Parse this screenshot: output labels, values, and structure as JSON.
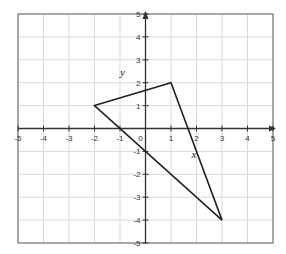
{
  "chart_data": {
    "type": "line",
    "title": "",
    "xlabel": "",
    "ylabel": "",
    "xlim": [
      -5,
      5
    ],
    "ylim": [
      -5,
      5
    ],
    "grid": true,
    "x_ticks": [
      -5,
      -4,
      -3,
      -2,
      -1,
      0,
      1,
      2,
      3,
      4,
      5
    ],
    "y_ticks": [
      -5,
      -4,
      -3,
      -2,
      -1,
      1,
      2,
      3,
      4,
      5
    ],
    "x_tick_labels": [
      "-5",
      "-4",
      "-3",
      "-2",
      "-1",
      "0",
      "1",
      "2",
      "3",
      "4",
      "5"
    ],
    "y_tick_labels": [
      "-5",
      "-4",
      "-3",
      "-2",
      "-1",
      "1",
      "2",
      "3",
      "4",
      "5"
    ],
    "series": [
      {
        "name": "triangle",
        "closed": true,
        "points": [
          [
            -2,
            1
          ],
          [
            1,
            2
          ],
          [
            3,
            -4
          ]
        ]
      }
    ],
    "annotations": [
      {
        "text": "y",
        "x": -0.9,
        "y": 2.3
      },
      {
        "text": "x",
        "x": 1.9,
        "y": -1.3
      }
    ],
    "colors": {
      "grid": "#d9d9d9",
      "frame": "#7a7a7a",
      "axis": "#333333",
      "shape": "#222222"
    }
  }
}
